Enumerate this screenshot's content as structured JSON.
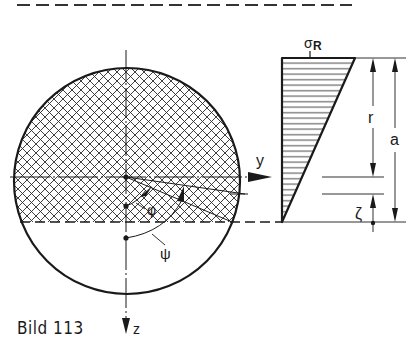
{
  "figure": {
    "caption": "Bild 113",
    "labels": {
      "y_axis": "y",
      "z_axis": "z",
      "sigma": "σ",
      "sigma_sub": "R",
      "phi": "φ",
      "psi": "ψ",
      "r": "r",
      "a": "a",
      "zeta": "ζ"
    },
    "colors": {
      "ink": "#1a1a1a",
      "background": "#ffffff"
    },
    "elements": [
      "dashed separator line at top",
      "circular cross-section with cross-hatched compression zone above dashed neutral line",
      "horizontal y-axis with arrow",
      "vertical z-axis with downward arrow",
      "angle arcs phi and psi from center",
      "triangular stress distribution with horizontal hatching, max sigma_R at top",
      "dimension lines r, a, zeta"
    ]
  }
}
